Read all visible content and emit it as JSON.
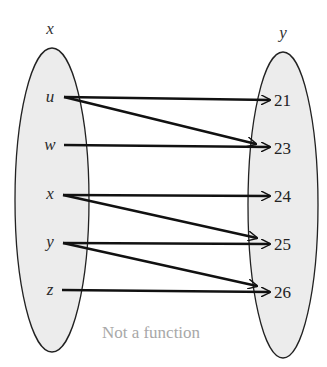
{
  "diagram": {
    "type": "mapping-diagram",
    "domain_set": {
      "title": "x",
      "elements": [
        "u",
        "w",
        "x",
        "y",
        "z"
      ]
    },
    "range_set": {
      "title": "y",
      "elements": [
        "21",
        "23",
        "24",
        "25",
        "26"
      ]
    },
    "mappings": [
      {
        "from": "u",
        "to": "21"
      },
      {
        "from": "u",
        "to": "23"
      },
      {
        "from": "w",
        "to": "23"
      },
      {
        "from": "x",
        "to": "24"
      },
      {
        "from": "x",
        "to": "25"
      },
      {
        "from": "y",
        "to": "25"
      },
      {
        "from": "y",
        "to": "26"
      },
      {
        "from": "z",
        "to": "26"
      }
    ],
    "caption": "Not a function",
    "colors": {
      "set_fill": "#ececec",
      "set_stroke": "#222222",
      "arrow": "#111111",
      "caption": "#a8a8a8"
    }
  }
}
